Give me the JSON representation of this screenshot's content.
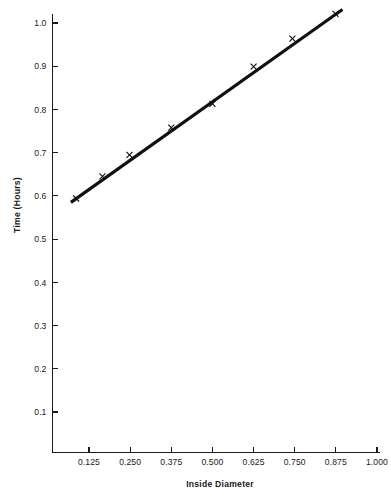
{
  "chart_data": {
    "type": "line",
    "title": "",
    "subtitle": "",
    "xlabel": "Inside Diameter",
    "ylabel": "Time (Hours)",
    "xlim": [
      0.055,
      1.0
    ],
    "ylim": [
      0.0,
      1.045
    ],
    "grid": false,
    "legend": null,
    "marker": "x",
    "line_color": "#111111",
    "marker_color": "#111111",
    "background_color": "#ffffff",
    "xticks": [
      0.125,
      0.25,
      0.375,
      0.5,
      0.625,
      0.75,
      0.875,
      1.0
    ],
    "xticklabels": [
      "0.125",
      "0.250",
      "0.375",
      "0.500",
      "0.625",
      "0.750",
      "0.875",
      "1.000"
    ],
    "yticks": [
      0.1,
      0.2,
      0.3,
      0.4,
      0.5,
      0.6,
      0.7,
      0.8,
      0.9,
      1.0
    ],
    "yticklabels": [
      "0.1",
      "0.2",
      "0.3",
      "0.4",
      "0.5",
      "0.6",
      "0.7",
      "0.8",
      "0.9",
      "1.0"
    ],
    "series": [
      {
        "name": "Time vs Inside Diameter",
        "x": [
          0.086,
          0.166,
          0.248,
          0.375,
          0.5,
          0.625,
          0.743,
          0.874
        ],
        "y": [
          0.594,
          0.645,
          0.695,
          0.758,
          0.813,
          0.899,
          0.964,
          1.021
        ]
      }
    ],
    "line_endpoints": {
      "x": [
        0.07,
        0.895
      ],
      "y": [
        0.585,
        1.031
      ]
    },
    "annotations": []
  },
  "figure": {
    "y_axis_title": "Time (Hours)",
    "x_axis_title": "Inside Diameter"
  }
}
